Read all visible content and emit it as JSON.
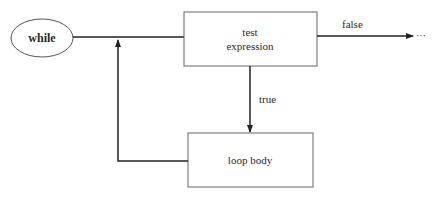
{
  "diagram": {
    "nodes": {
      "start": {
        "label": "while",
        "shape": "ellipse"
      },
      "test": {
        "label_line1": "test",
        "label_line2": "expression",
        "shape": "rectangle"
      },
      "body": {
        "label": "loop body",
        "shape": "rectangle"
      }
    },
    "edges": {
      "false": {
        "label": "false",
        "continuation": "···"
      },
      "true": {
        "label": "true"
      }
    },
    "colors": {
      "stroke": "#333333",
      "text": "#2a2a2a",
      "background": "#ffffff"
    }
  }
}
